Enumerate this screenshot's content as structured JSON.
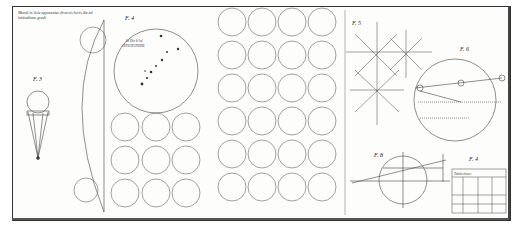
{
  "plate": {
    "caption": "Mundi in Sole apparentes diversis horis die ad latitudinem gradi",
    "figures": [
      {
        "id": "f3",
        "label": "F. 3"
      },
      {
        "id": "f4a",
        "label": "F. 4"
      },
      {
        "id": "f5",
        "label": "F. 5"
      },
      {
        "id": "f6",
        "label": "F. 6"
      },
      {
        "id": "f8",
        "label": "F. 8"
      },
      {
        "id": "f4b",
        "label": "F. 4"
      }
    ],
    "large_disc_label": "In Die 8 Jul 1637 ANTICIPATIONE",
    "table_header": "Tabula observ.",
    "colors": {
      "ink": "#333333",
      "paper": "#fdfdfc"
    }
  }
}
